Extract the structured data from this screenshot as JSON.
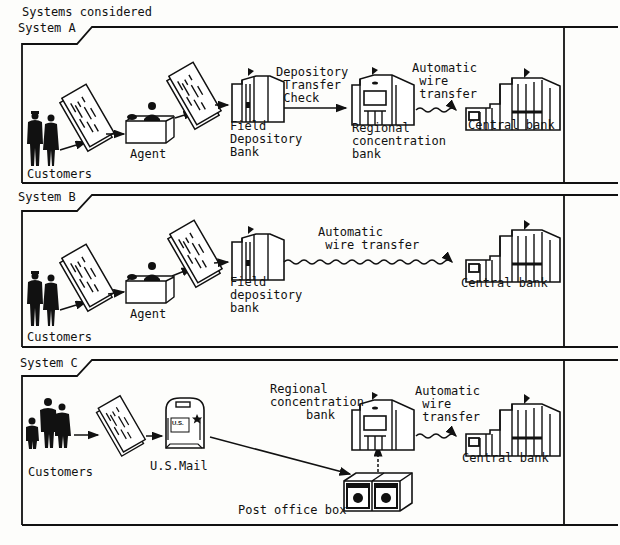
{
  "title": "Systems considered",
  "colors": {
    "ink": "#111111",
    "paper": "#fdfdfb"
  },
  "systems": [
    {
      "label": "System A",
      "nodes": {
        "customers": "Customers",
        "agent": "Agent",
        "field_bank": "Field\nDepository\nBank",
        "regional_bank": "Regional\nconcentration\nbank",
        "central_bank": "Central bank"
      },
      "links": {
        "depository_transfer": "Depository\n Transfer\n Check",
        "wire_transfer": "Automatic\n wire\n transfer"
      }
    },
    {
      "label": "System B",
      "nodes": {
        "customers": "Customers",
        "agent": "Agent",
        "field_bank": "Field\ndepository\nbank",
        "central_bank": "Central bank"
      },
      "links": {
        "wire_transfer": "Automatic\n wire transfer"
      }
    },
    {
      "label": "System C",
      "nodes": {
        "customers": "Customers",
        "mail": "U.S.Mail",
        "mailbox_text": "U.S.\nMAIL",
        "regional_bank": "Regional\nconcentration\n     bank",
        "po_box": "Post office box",
        "central_bank": "Central bank"
      },
      "links": {
        "wire_transfer": "Automatic\n wire\n transfer"
      }
    }
  ]
}
